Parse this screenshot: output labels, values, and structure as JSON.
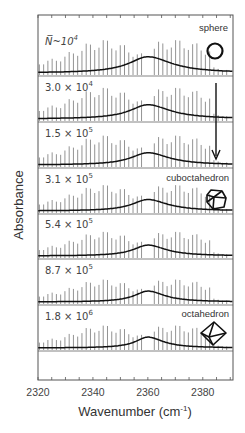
{
  "chart_data": {
    "type": "line",
    "title": "",
    "xlabel": "Wavenumber (cm⁻¹)",
    "xlabel_base": "Wavenumber (cm",
    "xlabel_sup": "-1",
    "xlabel_close": ")",
    "ylabel": "Absorbance",
    "xlim": [
      2320,
      2391
    ],
    "xticks": [
      2320,
      2340,
      2360,
      2380
    ],
    "grid": false,
    "stacked": true,
    "peak_center": 2360,
    "annotations": {
      "arrow": "trend arrow from sphere toward cuboctahedron",
      "shapes": [
        {
          "label": "sphere",
          "panel": 0,
          "icon": "circle"
        },
        {
          "label": "cuboctahedron",
          "panel": 3,
          "icon": "cuboctahedron"
        },
        {
          "label": "octahedron",
          "panel": 6,
          "icon": "octahedron"
        }
      ]
    },
    "series": [
      {
        "name": "N~10^4",
        "label_main": "N̅~10",
        "label_exp": "4",
        "broad_height": 0.82,
        "broad_width": 8.5,
        "line_scale": 1.0
      },
      {
        "name": "3.0 × 10^4",
        "label_main": "3.0 × 10",
        "label_exp": "4",
        "broad_height": 0.72,
        "broad_width": 8.0,
        "line_scale": 0.95
      },
      {
        "name": "1.5 × 10^5",
        "label_main": "1.5 × 10",
        "label_exp": "5",
        "broad_height": 0.62,
        "broad_width": 7.5,
        "line_scale": 0.9
      },
      {
        "name": "3.1 × 10^5",
        "label_main": "3.1 × 10",
        "label_exp": "5",
        "broad_height": 0.58,
        "broad_width": 7.0,
        "line_scale": 0.8
      },
      {
        "name": "5.4 × 10^5",
        "label_main": "5.4 × 10",
        "label_exp": "5",
        "broad_height": 0.55,
        "broad_width": 6.5,
        "line_scale": 0.75
      },
      {
        "name": "8.7 × 10^5",
        "label_main": "8.7 × 10",
        "label_exp": "5",
        "broad_height": 0.55,
        "broad_width": 6.0,
        "line_scale": 0.7
      },
      {
        "name": "1.8 × 10^6",
        "label_main": "1.8 × 10",
        "label_exp": "6",
        "broad_height": 0.55,
        "broad_width": 5.5,
        "line_scale": 0.7
      }
    ]
  }
}
